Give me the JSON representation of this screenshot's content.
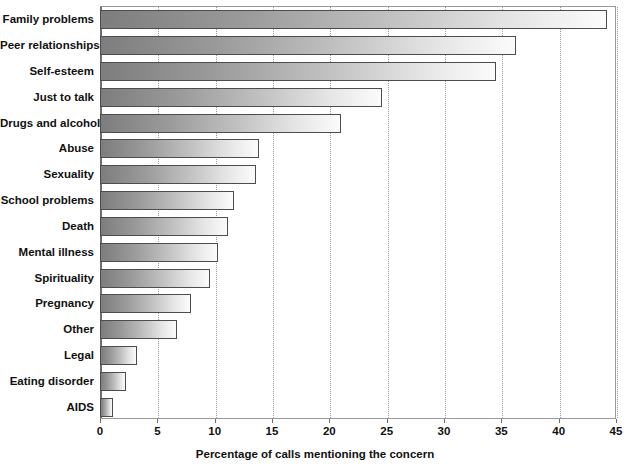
{
  "chart_data": {
    "type": "bar",
    "orientation": "horizontal",
    "title": "",
    "subtitle": "",
    "xlabel": "Percentage of calls mentioning the concern",
    "ylabel": "",
    "xlim": [
      0,
      45
    ],
    "xticks": [
      0,
      5,
      10,
      15,
      20,
      25,
      30,
      35,
      40,
      45
    ],
    "xtick_labels": [
      "0",
      "5",
      "10",
      "15",
      "20",
      "25",
      "30",
      "35",
      "40",
      "45"
    ],
    "grid": "vertical-dotted",
    "legend": "none",
    "categories": [
      "Family problems",
      "Peer relationships",
      "Self-esteem",
      "Just to talk",
      "Drugs and alcohol",
      "Abuse",
      "Sexuality",
      "School problems",
      "Death",
      "Mental illness",
      "Spirituality",
      "Pregnancy",
      "Other",
      "Legal",
      "Eating disorder",
      "AIDS"
    ],
    "values": [
      44.2,
      36.3,
      34.5,
      24.6,
      21.0,
      13.9,
      13.6,
      11.7,
      11.2,
      10.3,
      9.6,
      7.9,
      6.7,
      3.2,
      2.3,
      1.1
    ],
    "bar_fill": "gradient-gray-left-dark-to-right-light",
    "bar_border_color": "#4d4d4d",
    "gridline_color": "#9a9a9a",
    "axis_color": "#6e6e6e",
    "text_color": "#111111",
    "background": "#ffffff"
  }
}
